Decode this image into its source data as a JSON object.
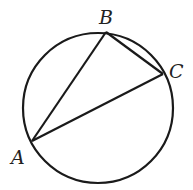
{
  "figure": {
    "type": "circle-inscribed-triangle",
    "stroke_color": "#1a1a1a",
    "circle": {
      "cx": 98,
      "cy": 108,
      "r": 75
    },
    "points": {
      "A": {
        "label": "A",
        "x": 32,
        "y": 141
      },
      "B": {
        "label": "B",
        "x": 106,
        "y": 32
      },
      "C": {
        "label": "C",
        "x": 163,
        "y": 74
      }
    },
    "segments": [
      "AB",
      "BC",
      "CA"
    ]
  }
}
